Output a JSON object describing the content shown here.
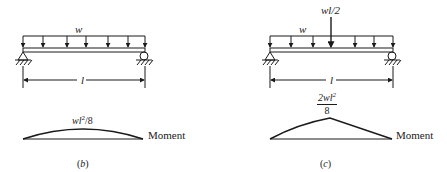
{
  "figures": [
    {
      "id": "b",
      "caption": "(b)",
      "load_label": "w",
      "span_label": "l",
      "moment_peak_label": "wl²/8",
      "moment_peak_parts": {
        "base": "wl",
        "exp": "2",
        "suffix": "/8"
      },
      "moment_axis_label": "Moment",
      "moment_shape": "parabolic"
    },
    {
      "id": "c",
      "caption": "(c)",
      "load_label": "w",
      "point_load_label": "wl/2",
      "span_label": "l",
      "moment_peak_label": "2wl²/8",
      "moment_peak_parts": {
        "numerator": "2wl",
        "exp": "2",
        "denominator": "8"
      },
      "moment_axis_label": "Moment",
      "moment_shape": "near-triangular"
    }
  ],
  "colors": {
    "ink": "#1a1a1a",
    "background": "#ffffff"
  }
}
